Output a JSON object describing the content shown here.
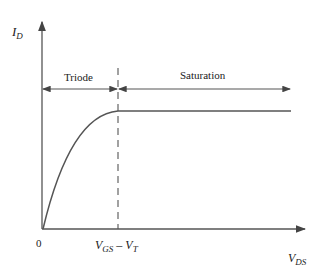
{
  "diagram": {
    "y_axis": {
      "symbol": "I",
      "subscript": "D"
    },
    "x_axis": {
      "symbol": "V",
      "subscript": "DS"
    },
    "origin_label": "0",
    "threshold_label": {
      "a": "V",
      "a_sub": "GS",
      "op": " – ",
      "b": "V",
      "b_sub": "T"
    },
    "regions": [
      {
        "name": "Triode"
      },
      {
        "name": "Saturation"
      }
    ],
    "colors": {
      "line": "#555555",
      "text": "#222222"
    }
  }
}
